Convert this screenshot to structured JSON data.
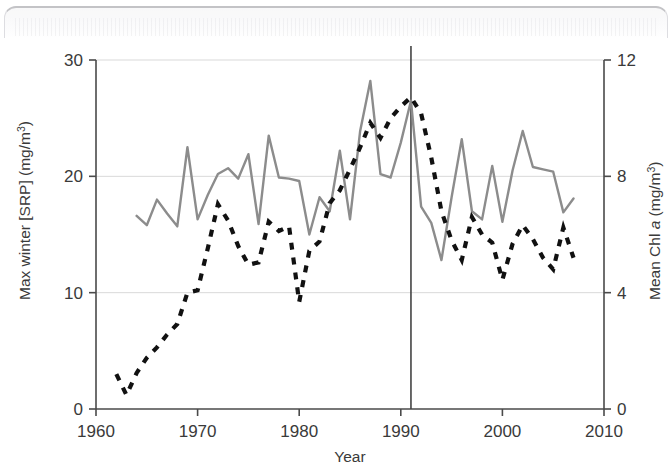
{
  "figure": {
    "background_color": "#ffffff",
    "has_scan_artifact": true
  },
  "chart_data": {
    "type": "line",
    "title": "",
    "xlabel": "Year",
    "ylabel": "Max winter [SRP] (mg/m3)",
    "y2label": "Mean Chl a (mg/m3)",
    "xlim": [
      1960,
      2010
    ],
    "ylim": [
      0,
      30
    ],
    "y2lim": [
      0,
      12
    ],
    "xticks": [
      1960,
      1970,
      1980,
      1990,
      2000,
      2010
    ],
    "xtick_labels": [
      "1960",
      "1970",
      "1980",
      "1990",
      "2000",
      "2010"
    ],
    "yticks": [
      0,
      10,
      20,
      30
    ],
    "ytick_labels": [
      "0",
      "10",
      "20",
      "30"
    ],
    "y2ticks": [
      0,
      4,
      8,
      12
    ],
    "y2tick_labels": [
      "0",
      "4",
      "8",
      "12"
    ],
    "grid": "horizontal",
    "grid_color": "#d9d9d9",
    "legend": "none",
    "annotations": [
      {
        "name": "intervention-line",
        "type": "vline",
        "x": 1991,
        "color": "#444444",
        "label": ""
      }
    ],
    "series": [
      {
        "name": "Max winter [SRP] (mg/m3)",
        "axis": "left",
        "style": "dashed",
        "color": "#111111",
        "linewidth": 4.2,
        "x": [
          1962,
          1963,
          1964,
          1965,
          1966,
          1967,
          1968,
          1969,
          1970,
          1971,
          1972,
          1973,
          1974,
          1975,
          1976,
          1977,
          1978,
          1979,
          1980,
          1981,
          1982,
          1983,
          1984,
          1985,
          1986,
          1987,
          1988,
          1989,
          1990,
          1991,
          1992,
          1993,
          1994,
          1995,
          1996,
          1997,
          1998,
          1999,
          2000,
          2001,
          2002,
          2003,
          2004,
          2005,
          2006,
          2007
        ],
        "values": [
          3.0,
          1.2,
          3.1,
          4.4,
          5.3,
          6.4,
          7.3,
          10.0,
          10.2,
          13.8,
          17.6,
          16.2,
          14.0,
          12.4,
          12.6,
          16.1,
          15.3,
          15.7,
          9.2,
          13.6,
          14.4,
          17.7,
          18.8,
          20.6,
          22.5,
          24.6,
          23.3,
          25.0,
          26.0,
          26.8,
          25.4,
          21.6,
          17.0,
          14.5,
          12.8,
          16.5,
          15.0,
          14.3,
          11.1,
          14.2,
          15.8,
          14.6,
          13.0,
          12.0,
          15.6,
          13.0
        ]
      },
      {
        "name": "Mean Chl a (mg/m3)",
        "axis": "right",
        "style": "solid",
        "color": "#8c8c8c",
        "linewidth": 2.4,
        "x": [
          1964,
          1965,
          1966,
          1967,
          1968,
          1969,
          1970,
          1971,
          1972,
          1973,
          1974,
          1975,
          1976,
          1977,
          1978,
          1979,
          1980,
          1981,
          1982,
          1983,
          1984,
          1985,
          1986,
          1987,
          1988,
          1989,
          1990,
          1991,
          1992,
          1993,
          1994,
          1995,
          1996,
          1997,
          1998,
          1999,
          2000,
          2001,
          2002,
          2003,
          2004,
          2005,
          2006,
          2007
        ],
        "values_left_scale": [
          16.6,
          15.8,
          18.0,
          16.8,
          15.7,
          22.5,
          16.3,
          18.4,
          20.2,
          20.7,
          19.8,
          21.9,
          15.9,
          23.5,
          19.9,
          19.8,
          19.6,
          15.0,
          18.2,
          17.0,
          22.2,
          16.3,
          23.9,
          28.2,
          20.2,
          19.9,
          22.9,
          26.5,
          17.4,
          16.0,
          12.8,
          18.2,
          23.2,
          17.0,
          16.3,
          20.9,
          16.1,
          20.5,
          23.9,
          20.8,
          20.6,
          20.4,
          16.9,
          18.1
        ]
      }
    ]
  }
}
